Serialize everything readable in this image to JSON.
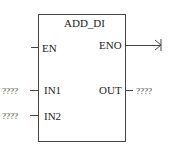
{
  "block": {
    "title": "ADD_DI",
    "inputs": [
      {
        "name": "EN"
      },
      {
        "name": "IN1",
        "value": "????"
      },
      {
        "name": "IN2",
        "value": "????"
      }
    ],
    "outputs": [
      {
        "name": "ENO"
      },
      {
        "name": "OUT",
        "value": "????"
      }
    ]
  }
}
